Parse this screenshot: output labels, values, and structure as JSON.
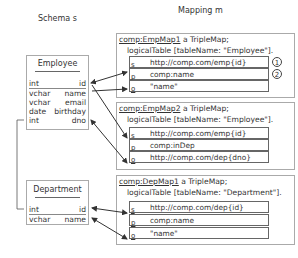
{
  "headers": {
    "schema": "Schema s",
    "mapping": "Mapping m"
  },
  "schema": {
    "tables": [
      {
        "name": "Employee",
        "columns": [
          {
            "type": "int",
            "name": "id"
          },
          {
            "type": "vchar",
            "name": "name"
          },
          {
            "type": "vchar",
            "name": "email"
          },
          {
            "type": "date",
            "name": "birthday"
          },
          {
            "type": "int",
            "name": "dno"
          }
        ]
      },
      {
        "name": "Department",
        "columns": [
          {
            "type": "int",
            "name": "id"
          },
          {
            "type": "vchar",
            "name": "name"
          }
        ]
      }
    ]
  },
  "mapping": {
    "maps": [
      {
        "id": "comp:EmpMap1",
        "suffix": " a TripleMap;",
        "logical_table": "logicalTable [tableName: \"Employee\"].",
        "rows": [
          {
            "key": "s",
            "value": "http://comp.com/emp{id}",
            "marker": "1"
          },
          {
            "key": "p",
            "value": "comp:name",
            "marker": "2"
          },
          {
            "key": "o",
            "value": "\"name\""
          }
        ]
      },
      {
        "id": "comp:EmpMap2",
        "suffix": " a TripleMap;",
        "logical_table": "logicalTable [tableName: \"Employee\"].",
        "rows": [
          {
            "key": "s",
            "value": "http://comp.com/emp{id}"
          },
          {
            "key": "p",
            "value": "comp:inDep"
          },
          {
            "key": "o",
            "value": "http://comp.com/dep{dno}"
          }
        ]
      },
      {
        "id": "comp:DepMap1",
        "suffix": " a TripleMap;",
        "logical_table": "logicalTable [tableName: \"Department\"].",
        "rows": [
          {
            "key": "s",
            "value": "http://comp.com/dep{id}"
          },
          {
            "key": "p",
            "value": "comp:name"
          },
          {
            "key": "o",
            "value": "\"name\""
          }
        ]
      }
    ]
  }
}
